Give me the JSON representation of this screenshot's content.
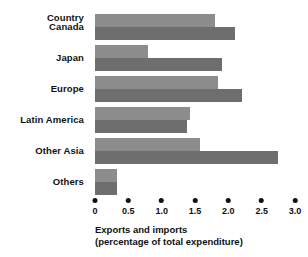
{
  "chart_data": {
    "type": "bar",
    "orientation": "horizontal",
    "title": "",
    "xlabel": "Exports and imports (percentage of total expenditure)",
    "ylabel": "Country",
    "xlim": [
      0,
      3.0
    ],
    "grid": false,
    "legend": "none",
    "xticks": [
      "0",
      "0.5",
      "1.0",
      "1.5",
      "2.0",
      "2.5",
      "3.0"
    ],
    "xtick_values": [
      0,
      0.5,
      1.0,
      1.5,
      2.0,
      2.5,
      3.0
    ],
    "categories": [
      "Canada",
      "Japan",
      "Europe",
      "Latin America",
      "Other Asia",
      "Others"
    ],
    "series": [
      {
        "name": "Exports",
        "color": "#8c8c8c",
        "values": [
          1.8,
          0.8,
          1.85,
          1.42,
          1.57,
          0.33
        ]
      },
      {
        "name": "Imports",
        "color": "#6e6e6e",
        "values": [
          2.1,
          1.9,
          2.2,
          1.38,
          2.75,
          0.33
        ]
      }
    ]
  },
  "axis": {
    "header_label": "Country",
    "caption_line1": "Exports and imports",
    "caption_line2": "(percentage of total expenditure)"
  },
  "colors": {
    "bar_light": "#8c8c8c",
    "bar_dark": "#6e6e6e",
    "text": "#111111",
    "background": "#ffffff"
  }
}
